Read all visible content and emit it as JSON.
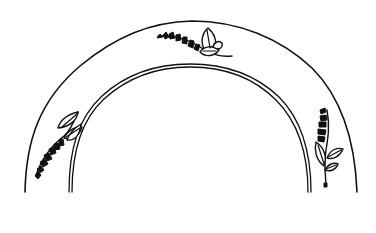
{
  "illustration": {
    "subject": "Plate rim line drawing with floral sprigs",
    "colors": {
      "background": "#ffffff",
      "ink": "#111111"
    },
    "rim": {
      "outer_arc": {
        "left_x": 25,
        "right_x": 357,
        "top_y": 21,
        "bottom_y": 192
      },
      "inner_arc_1": {
        "left_x": 69,
        "right_x": 311,
        "top_y": 64,
        "bottom_y": 192
      },
      "inner_arc_2": {
        "left_x": 72,
        "right_x": 308,
        "top_y": 67,
        "bottom_y": 192
      }
    },
    "motifs": [
      {
        "name": "top-sprig",
        "position": "top center",
        "description": "bell-flower spray with leaves"
      },
      {
        "name": "left-sprig",
        "position": "left side",
        "description": "bell-flower spray with leaves"
      },
      {
        "name": "right-sprig",
        "position": "right side",
        "description": "bell-flower spray with leaves"
      }
    ]
  }
}
